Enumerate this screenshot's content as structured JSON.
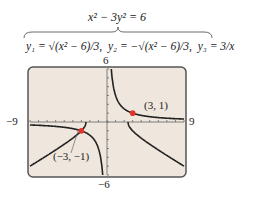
{
  "equation": "x² − 3y² = 6",
  "functions": [
    "y₁ = √(x² − 6)/3,",
    "y₂ = −√(x² − 6)/3,",
    "y₃ = 3/x"
  ],
  "axis_labels": {
    "xmin": "−9",
    "xmax": "9",
    "ymin": "−6",
    "ymax": "6"
  },
  "points": [
    {
      "label": "(3, 1)",
      "x": 3,
      "y": 1
    },
    {
      "label": "(−3, −1)",
      "x": -3,
      "y": -1
    }
  ],
  "colors": {
    "screen": "#efe6dd",
    "curve": "#222222",
    "point": "#e0332a",
    "border": "#555555"
  },
  "chart_data": {
    "type": "line",
    "xlim": [
      -9,
      9
    ],
    "ylim": [
      -6,
      6
    ],
    "series": [
      {
        "name": "y₁ = √((x² − 6)/3)"
      },
      {
        "name": "y₂ = −√((x² − 6)/3)"
      },
      {
        "name": "y₃ = 3/x"
      }
    ],
    "annotations": [
      "(3, 1)",
      "(−3, −1)"
    ]
  }
}
